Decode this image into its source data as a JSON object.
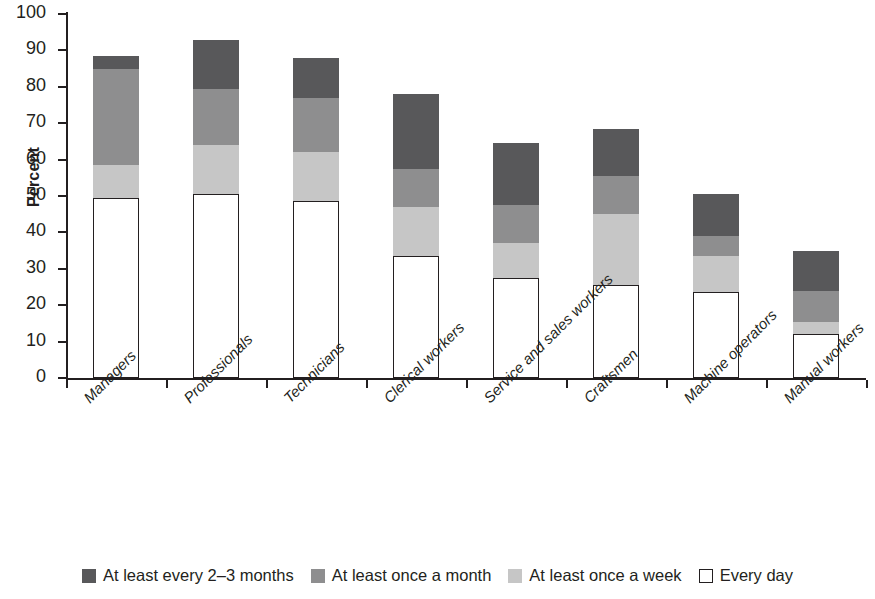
{
  "chart_data": {
    "type": "bar",
    "subtype": "stacked-bar",
    "title": "",
    "xlabel": "",
    "ylabel": "Percent",
    "ylim": [
      0,
      100
    ],
    "yticks": [
      0,
      10,
      20,
      30,
      40,
      50,
      60,
      70,
      80,
      90,
      100
    ],
    "grid": false,
    "legend_position": "bottom",
    "categories": [
      "Managers",
      "Professionals",
      "Technicians",
      "Clerical workers",
      "Service and sales workers",
      "Craftsmen",
      "Machine operators",
      "Manual workers"
    ],
    "series": [
      {
        "name": "Every day",
        "color": "#ffffff",
        "outlined": true,
        "values": [
          49.5,
          50.5,
          48.5,
          33.5,
          27.5,
          25.5,
          23.5,
          12.0
        ]
      },
      {
        "name": "At least once a week",
        "color": "#c6c6c6",
        "outlined": false,
        "values": [
          9.0,
          13.5,
          13.5,
          13.5,
          9.5,
          19.5,
          10.0,
          3.5
        ]
      },
      {
        "name": "At least once a month",
        "color": "#8e8e8f",
        "outlined": false,
        "values": [
          26.5,
          15.5,
          15.0,
          10.5,
          10.5,
          10.5,
          5.5,
          8.5
        ]
      },
      {
        "name": "At least every 2–3 months",
        "color": "#58585a",
        "outlined": false,
        "values": [
          3.5,
          13.5,
          11.0,
          20.5,
          17.0,
          13.0,
          11.5,
          11.0
        ]
      }
    ],
    "totals": [
      88.5,
      93.0,
      88.0,
      78.0,
      64.5,
      68.5,
      50.5,
      35.0
    ]
  },
  "legend": {
    "items": [
      {
        "label": "At least every 2–3 months",
        "swatch": "dark-gray-swatch",
        "color": "#58585a",
        "outlined": false
      },
      {
        "label": "At least once a month",
        "swatch": "medium-gray-swatch",
        "color": "#8e8e8f",
        "outlined": false
      },
      {
        "label": "At least once a week",
        "swatch": "light-gray-swatch",
        "color": "#c6c6c6",
        "outlined": false
      },
      {
        "label": "Every day",
        "swatch": "white-outline-swatch",
        "color": "#ffffff",
        "outlined": true
      }
    ]
  }
}
